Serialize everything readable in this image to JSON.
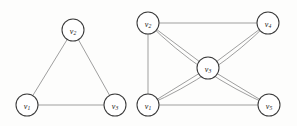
{
  "figure": {
    "background_color": "#fdfdfc",
    "edge_color": "#8e8e8e",
    "node_fill": "#ffffff",
    "node_stroke": "#3a3a3a",
    "label_color": "#1a1a1a"
  },
  "graphs": [
    {
      "name": "left-graph",
      "node_radius": 11,
      "nodes": [
        {
          "id": "v1",
          "letter": "v",
          "subscript": "1",
          "x": 27,
          "y": 105
        },
        {
          "id": "v2",
          "letter": "v",
          "subscript": "2",
          "x": 73,
          "y": 30
        },
        {
          "id": "v3",
          "letter": "v",
          "subscript": "3",
          "x": 115,
          "y": 105
        }
      ],
      "edges": [
        {
          "from": "v1",
          "to": "v2",
          "curve": 0
        },
        {
          "from": "v2",
          "to": "v3",
          "curve": 0
        },
        {
          "from": "v1",
          "to": "v3",
          "curve": 0
        }
      ]
    },
    {
      "name": "right-graph",
      "node_radius": 11,
      "nodes": [
        {
          "id": "v1",
          "letter": "v",
          "subscript": "1",
          "x": 148,
          "y": 105
        },
        {
          "id": "v2",
          "letter": "v",
          "subscript": "2",
          "x": 148,
          "y": 23
        },
        {
          "id": "v3",
          "letter": "v",
          "subscript": "3",
          "x": 208,
          "y": 68
        },
        {
          "id": "v4",
          "letter": "v",
          "subscript": "4",
          "x": 268,
          "y": 23
        },
        {
          "id": "v5",
          "letter": "v",
          "subscript": "5",
          "x": 269,
          "y": 105
        }
      ],
      "edges": [
        {
          "from": "v2",
          "to": "v4",
          "curve": 0
        },
        {
          "from": "v2",
          "to": "v1",
          "curve": 0
        },
        {
          "from": "v2",
          "to": "v3",
          "curve": 0
        },
        {
          "from": "v2",
          "to": "v5",
          "curve": 14
        },
        {
          "from": "v4",
          "to": "v3",
          "curve": 0
        },
        {
          "from": "v4",
          "to": "v1",
          "curve": -14
        },
        {
          "from": "v1",
          "to": "v3",
          "curve": 0
        },
        {
          "from": "v1",
          "to": "v5",
          "curve": 0
        },
        {
          "from": "v3",
          "to": "v5",
          "curve": 0
        }
      ]
    }
  ]
}
